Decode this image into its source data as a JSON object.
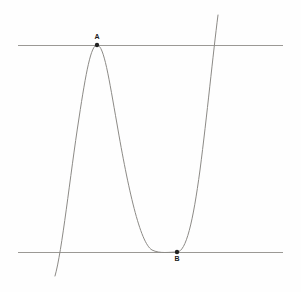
{
  "figure": {
    "background_color": "#fefefe"
  },
  "chart_data": {
    "type": "line",
    "title": "",
    "subtitle": "",
    "xlabel": "",
    "ylabel": "",
    "grid": false,
    "legend": false,
    "axis_visible": false,
    "xlim": [
      0,
      301
    ],
    "ylim": [
      292,
      0
    ],
    "annotations": [
      {
        "name": "local-maximum",
        "label": "A",
        "x": 97,
        "y": 45,
        "label_position": "above",
        "label_x": 97,
        "label_y": 37,
        "marker": "dot",
        "marker_color": "#222222",
        "marker_size": 2.2
      },
      {
        "name": "local-minimum",
        "label": "B",
        "x": 177,
        "y": 252,
        "label_position": "below",
        "label_x": 177,
        "label_y": 259,
        "marker": "dot",
        "marker_color": "#222222",
        "marker_size": 2.2
      }
    ],
    "series": [
      {
        "name": "cubic-curve",
        "kind": "curve",
        "color": "#8c8a86",
        "width": 1,
        "path": "M 55,276 C 62,252 70,176 79,118 C 86,72 91,45 97,45 C 104,45 109,79 117,124 C 128,188 140,243 152,250 C 160,254 170,252 177,252 C 186,252 193,222 200,170 C 207,116 213,54 218,15",
        "points": [
          {
            "x": 55,
            "y": 276
          },
          {
            "x": 66,
            "y": 205
          },
          {
            "x": 79,
            "y": 118
          },
          {
            "x": 88,
            "y": 66
          },
          {
            "x": 97,
            "y": 45
          },
          {
            "x": 108,
            "y": 72
          },
          {
            "x": 120,
            "y": 136
          },
          {
            "x": 136,
            "y": 207
          },
          {
            "x": 152,
            "y": 244
          },
          {
            "x": 165,
            "y": 252
          },
          {
            "x": 177,
            "y": 252
          },
          {
            "x": 190,
            "y": 218
          },
          {
            "x": 202,
            "y": 155
          },
          {
            "x": 211,
            "y": 86
          },
          {
            "x": 218,
            "y": 15
          }
        ]
      },
      {
        "name": "upper-tangent-line",
        "kind": "horizontal-line",
        "color": "#9b9995",
        "width": 1,
        "y": 45,
        "x_start": 18,
        "x_end": 283
      },
      {
        "name": "lower-tangent-line",
        "kind": "horizontal-line",
        "color": "#9b9995",
        "width": 1,
        "y": 252,
        "x_start": 18,
        "x_end": 283
      }
    ]
  }
}
